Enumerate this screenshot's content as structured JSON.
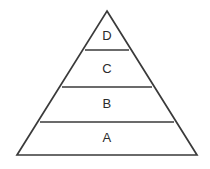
{
  "figure": {
    "name": "four-tier-pyramid-diagram",
    "type": "pyramid",
    "background_color": "#ffffff",
    "line_color": "#3a3a3a",
    "label_color": "#2b2b2b",
    "line_width": 1.7,
    "apex": {
      "x": 107,
      "y": 11
    },
    "base_left": {
      "x": 17,
      "y": 155
    },
    "base_right": {
      "x": 197,
      "y": 155
    },
    "tiers": [
      {
        "label": "D",
        "position": "top",
        "level": 4,
        "divider_y": 50,
        "divider_x1": 85,
        "divider_x2": 129,
        "label_x": 107,
        "label_y": 37
      },
      {
        "label": "C",
        "position": "upper-middle",
        "level": 3,
        "divider_y": 87,
        "divider_x1": 62,
        "divider_x2": 152,
        "label_x": 107,
        "label_y": 70
      },
      {
        "label": "B",
        "position": "lower-middle",
        "level": 2,
        "divider_y": 122,
        "divider_x1": 40,
        "divider_x2": 174,
        "label_x": 107,
        "label_y": 105
      },
      {
        "label": "A",
        "position": "bottom",
        "level": 1,
        "divider_y": 155,
        "divider_x1": 17,
        "divider_x2": 197,
        "label_x": 107,
        "label_y": 139
      }
    ]
  }
}
